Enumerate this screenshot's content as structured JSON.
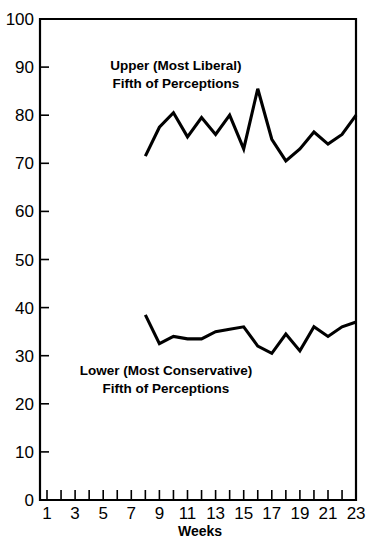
{
  "chart_data": {
    "type": "line",
    "title": "",
    "xlabel": "Weeks",
    "ylabel": "",
    "xlim": [
      0,
      24
    ],
    "ylim": [
      0,
      100
    ],
    "grid": false,
    "legend_position": "inline-annotation",
    "x_tick_values": [
      1,
      2,
      3,
      4,
      5,
      6,
      7,
      8,
      9,
      10,
      11,
      12,
      13,
      14,
      15,
      16,
      17,
      18,
      19,
      20,
      21,
      22,
      23
    ],
    "x_tick_labels": [
      "1",
      "",
      "3",
      "",
      "5",
      "",
      "7",
      "",
      "9",
      "",
      "11",
      "",
      "13",
      "",
      "15",
      "",
      "17",
      "",
      "19",
      "",
      "21",
      "",
      "23"
    ],
    "y_tick_values": [
      0,
      10,
      20,
      30,
      40,
      50,
      60,
      70,
      80,
      90,
      100
    ],
    "y_tick_labels": [
      "0",
      "10",
      "20",
      "30",
      "40",
      "50",
      "60",
      "70",
      "80",
      "90",
      "100"
    ],
    "x": [
      8,
      9,
      10,
      11,
      12,
      13,
      14,
      15,
      16,
      17,
      18,
      19,
      20,
      21,
      22,
      23
    ],
    "series": [
      {
        "name": "Upper (Most Liberal) Fifth of Perceptions",
        "annotation_line1": "Upper (Most Liberal)",
        "annotation_line2": "Fifth of Perceptions",
        "values": [
          71.5,
          77.5,
          80.5,
          75.5,
          79.5,
          76,
          80,
          73,
          85.5,
          75,
          70.5,
          73,
          76.5,
          74,
          76,
          80
        ]
      },
      {
        "name": "Lower (Most Conservative) Fifth of Perceptions",
        "annotation_line1": "Lower (Most Conservative)",
        "annotation_line2": "Fifth of Perceptions",
        "values": [
          38.5,
          32.5,
          34,
          33.5,
          33.5,
          35,
          35.5,
          36,
          32,
          30.5,
          34.5,
          31,
          36,
          34,
          36,
          37
        ]
      }
    ]
  },
  "axes": {
    "x_axis_title": "Weeks"
  },
  "annotations": {
    "upper_label_line1": "Upper (Most Liberal)",
    "upper_label_line2": "Fifth of Perceptions",
    "lower_label_line1": "Lower (Most Conservative)",
    "lower_label_line2": "Fifth of Perceptions"
  }
}
